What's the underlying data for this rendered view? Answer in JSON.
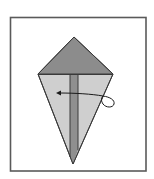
{
  "diagram": {
    "type": "origami-step",
    "colors": {
      "background": "#ffffff",
      "frame": "#5a5a5a",
      "top_flap": "#8c8c8c",
      "lower_body": "#cfcfcf",
      "center_strip": "#8f8f8f",
      "edge": "#3a3a3a",
      "arrow": "#1a1a1a"
    },
    "frame": {
      "x": 10,
      "y": 17,
      "w": 136,
      "h": 154
    },
    "shape": {
      "top": [
        74,
        37
      ],
      "left": [
        38,
        74
      ],
      "right": [
        113,
        74
      ],
      "bottom": [
        73,
        164
      ]
    },
    "center_strip": {
      "x1": 70,
      "x2": 78
    },
    "arrow": {
      "direction": "left",
      "meaning": "fold behind / turn flap over",
      "head": [
        57,
        93
      ]
    }
  }
}
